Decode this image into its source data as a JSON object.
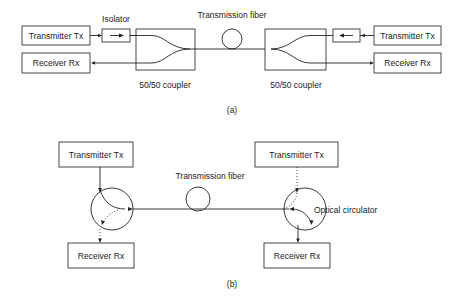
{
  "diagram": {
    "panel_a": {
      "caption": "(a)",
      "left": {
        "transmitter": "Transmitter Tx",
        "receiver": "Receiver Rx",
        "isolator_label": "Isolator",
        "coupler_label": "50/50 coupler"
      },
      "fiber_label": "Transmission fiber",
      "right": {
        "transmitter": "Transmitter Tx",
        "receiver": "Receiver Rx",
        "coupler_label": "50/50 coupler"
      }
    },
    "panel_b": {
      "caption": "(b)",
      "left": {
        "transmitter": "Transmitter Tx",
        "receiver": "Receiver Rx"
      },
      "fiber_label": "Transmission fiber",
      "right": {
        "transmitter": "Transmitter Tx",
        "receiver": "Receiver Rx",
        "circulator_label": "Optical circulator"
      }
    },
    "colors": {
      "line": "#222222",
      "background": "#ffffff"
    }
  }
}
